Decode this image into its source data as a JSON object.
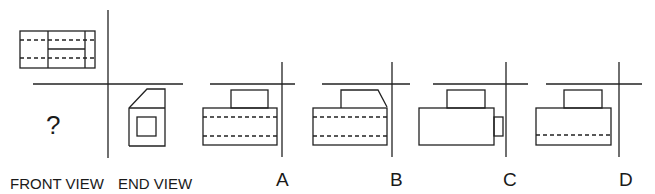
{
  "question_mark": "?",
  "labels": {
    "front_view": "FRONT VIEW",
    "end_view": "END VIEW"
  },
  "options": [
    {
      "letter": "A"
    },
    {
      "letter": "B"
    },
    {
      "letter": "C"
    },
    {
      "letter": "D"
    }
  ]
}
